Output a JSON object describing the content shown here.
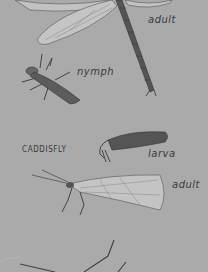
{
  "sections": [
    {
      "name": "dragonfly",
      "stages": [
        {
          "label": "adult"
        },
        {
          "label": "nymph"
        }
      ]
    },
    {
      "name": "caddisfly",
      "heading": "CADDISFLY",
      "stages": [
        {
          "label": "larva"
        },
        {
          "label": "adult"
        }
      ]
    }
  ],
  "colors": {
    "background": "#aaaaaa",
    "ink": "#3a3a3a",
    "wing_fill": "#c4c4c4"
  }
}
